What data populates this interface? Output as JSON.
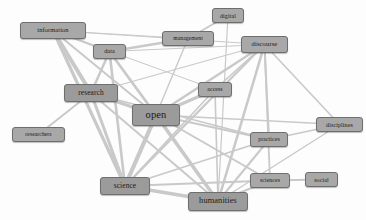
{
  "diagram": {
    "type": "node-link-network",
    "canvas": {
      "width": 366,
      "height": 220
    },
    "style": {
      "background": "#fdfdfd",
      "node_fill": "#a8a8a8",
      "node_fill_emphasis": "#9b9b9b",
      "node_border": "#6e6e6e",
      "node_text": "#1a1a1a",
      "edge_color": "#c9c9c9"
    },
    "nodes": [
      {
        "id": "information",
        "label": "information",
        "x": 20,
        "y": 22,
        "w": 66,
        "h": 17,
        "font": 6.4,
        "weight": "normal"
      },
      {
        "id": "data",
        "label": "data",
        "x": 93,
        "y": 44,
        "w": 33,
        "h": 15,
        "font": 6.2,
        "weight": "normal"
      },
      {
        "id": "management",
        "label": "management",
        "x": 162,
        "y": 31,
        "w": 52,
        "h": 15,
        "font": 5.6,
        "weight": "normal"
      },
      {
        "id": "digital",
        "label": "digital",
        "x": 212,
        "y": 8,
        "w": 32,
        "h": 15,
        "font": 6.0,
        "weight": "normal"
      },
      {
        "id": "discourse",
        "label": "discourse",
        "x": 241,
        "y": 36,
        "w": 47,
        "h": 17,
        "font": 6.6,
        "weight": "normal"
      },
      {
        "id": "research",
        "label": "research",
        "x": 64,
        "y": 84,
        "w": 54,
        "h": 18,
        "font": 7.4,
        "weight": "normal"
      },
      {
        "id": "access",
        "label": "access",
        "x": 198,
        "y": 82,
        "w": 34,
        "h": 15,
        "font": 5.8,
        "weight": "normal"
      },
      {
        "id": "open",
        "label": "open",
        "x": 132,
        "y": 104,
        "w": 48,
        "h": 22,
        "font": 10.5,
        "weight": "normal"
      },
      {
        "id": "researchers",
        "label": "researchers",
        "x": 12,
        "y": 127,
        "w": 53,
        "h": 15,
        "font": 5.6,
        "weight": "normal"
      },
      {
        "id": "practices",
        "label": "practices",
        "x": 250,
        "y": 132,
        "w": 38,
        "h": 15,
        "font": 5.8,
        "weight": "normal"
      },
      {
        "id": "disciplines",
        "label": "disciplines",
        "x": 316,
        "y": 117,
        "w": 47,
        "h": 15,
        "font": 6.0,
        "weight": "normal"
      },
      {
        "id": "science",
        "label": "science",
        "x": 100,
        "y": 177,
        "w": 50,
        "h": 18,
        "font": 7.4,
        "weight": "normal"
      },
      {
        "id": "sciences",
        "label": "sciences",
        "x": 250,
        "y": 173,
        "w": 40,
        "h": 15,
        "font": 5.8,
        "weight": "normal"
      },
      {
        "id": "social",
        "label": "social",
        "x": 305,
        "y": 172,
        "w": 33,
        "h": 15,
        "font": 6.0,
        "weight": "normal"
      },
      {
        "id": "humanities",
        "label": "humanities",
        "x": 188,
        "y": 192,
        "w": 60,
        "h": 19,
        "font": 8.4,
        "weight": "normal"
      }
    ],
    "edges": [
      {
        "source": "information",
        "target": "data",
        "weight": 2.2
      },
      {
        "source": "information",
        "target": "research",
        "weight": 4.0
      },
      {
        "source": "information",
        "target": "open",
        "weight": 2.0
      },
      {
        "source": "information",
        "target": "science",
        "weight": 3.2
      },
      {
        "source": "information",
        "target": "management",
        "weight": 1.2
      },
      {
        "source": "information",
        "target": "discourse",
        "weight": 1.2
      },
      {
        "source": "information",
        "target": "access",
        "weight": 1.0
      },
      {
        "source": "data",
        "target": "research",
        "weight": 2.4
      },
      {
        "source": "data",
        "target": "open",
        "weight": 2.6
      },
      {
        "source": "data",
        "target": "science",
        "weight": 2.6
      },
      {
        "source": "data",
        "target": "management",
        "weight": 2.4
      },
      {
        "source": "data",
        "target": "humanities",
        "weight": 1.6
      },
      {
        "source": "data",
        "target": "discourse",
        "weight": 1.2
      },
      {
        "source": "management",
        "target": "digital",
        "weight": 1.8
      },
      {
        "source": "management",
        "target": "open",
        "weight": 1.4
      },
      {
        "source": "digital",
        "target": "humanities",
        "weight": 1.2
      },
      {
        "source": "discourse",
        "target": "open",
        "weight": 2.4
      },
      {
        "source": "discourse",
        "target": "access",
        "weight": 1.6
      },
      {
        "source": "discourse",
        "target": "practices",
        "weight": 2.0
      },
      {
        "source": "discourse",
        "target": "science",
        "weight": 2.2
      },
      {
        "source": "discourse",
        "target": "humanities",
        "weight": 2.6
      },
      {
        "source": "discourse",
        "target": "sciences",
        "weight": 1.8
      },
      {
        "source": "discourse",
        "target": "disciplines",
        "weight": 1.6
      },
      {
        "source": "discourse",
        "target": "research",
        "weight": 1.2
      },
      {
        "source": "research",
        "target": "open",
        "weight": 3.4
      },
      {
        "source": "research",
        "target": "science",
        "weight": 3.0
      },
      {
        "source": "research",
        "target": "researchers",
        "weight": 2.0
      },
      {
        "source": "research",
        "target": "humanities",
        "weight": 2.0
      },
      {
        "source": "research",
        "target": "practices",
        "weight": 1.4
      },
      {
        "source": "access",
        "target": "open",
        "weight": 3.0
      },
      {
        "source": "access",
        "target": "science",
        "weight": 1.6
      },
      {
        "source": "access",
        "target": "humanities",
        "weight": 1.6
      },
      {
        "source": "open",
        "target": "science",
        "weight": 4.2
      },
      {
        "source": "open",
        "target": "humanities",
        "weight": 3.6
      },
      {
        "source": "open",
        "target": "practices",
        "weight": 2.2
      },
      {
        "source": "open",
        "target": "sciences",
        "weight": 2.0
      },
      {
        "source": "open",
        "target": "disciplines",
        "weight": 1.4
      },
      {
        "source": "science",
        "target": "humanities",
        "weight": 3.4
      },
      {
        "source": "science",
        "target": "practices",
        "weight": 1.6
      },
      {
        "source": "science",
        "target": "sciences",
        "weight": 1.8
      },
      {
        "source": "humanities",
        "target": "practices",
        "weight": 2.0
      },
      {
        "source": "humanities",
        "target": "sciences",
        "weight": 2.0
      },
      {
        "source": "humanities",
        "target": "disciplines",
        "weight": 1.4
      },
      {
        "source": "practices",
        "target": "disciplines",
        "weight": 1.6
      },
      {
        "source": "sciences",
        "target": "social",
        "weight": 2.0
      }
    ]
  }
}
